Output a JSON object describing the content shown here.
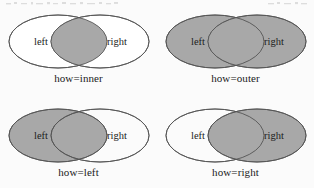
{
  "figure": {
    "title": "",
    "background_color": "#fbfbfb",
    "fill_color": "#a8a8a8",
    "outline_color": "#555555",
    "empty_color": "#ffffff",
    "label_left": "left",
    "label_right": "right"
  },
  "diagrams": [
    {
      "id": "inner",
      "caption": "how=inner",
      "label_left": "left",
      "label_right": "right",
      "left_filled": false,
      "right_filled": false,
      "intersection_filled": true
    },
    {
      "id": "outer",
      "caption": "how=outer",
      "label_left": "left",
      "label_right": "right",
      "left_filled": true,
      "right_filled": true,
      "intersection_filled": true
    },
    {
      "id": "left",
      "caption": "how=left",
      "label_left": "left",
      "label_right": "right",
      "left_filled": true,
      "right_filled": false,
      "intersection_filled": true
    },
    {
      "id": "right",
      "caption": "how=right",
      "label_left": "left",
      "label_right": "right",
      "left_filled": false,
      "right_filled": true,
      "intersection_filled": true
    }
  ]
}
